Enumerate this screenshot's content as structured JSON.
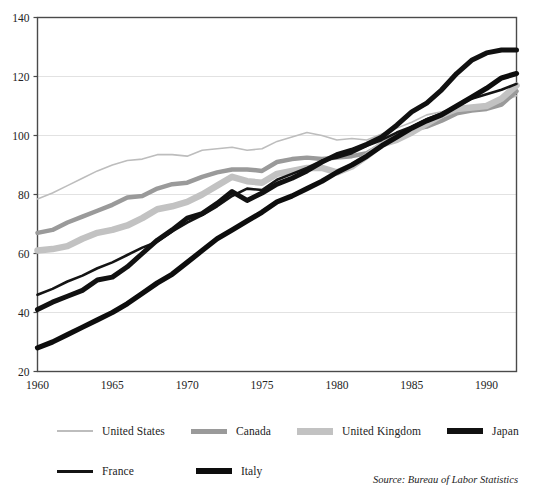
{
  "chart_data": {
    "type": "line",
    "title": "",
    "subtitle": "",
    "xlabel": "",
    "ylabel": "",
    "xlim": [
      1960,
      1992
    ],
    "ylim": [
      20,
      140
    ],
    "x_ticks": [
      1960,
      1965,
      1970,
      1975,
      1980,
      1985,
      1990
    ],
    "y_ticks": [
      20,
      40,
      60,
      80,
      100,
      120,
      140
    ],
    "grid": "horizontal",
    "legend_position": "below",
    "source_note": "Source: Bureau of Labor Statistics",
    "x": [
      1960,
      1961,
      1962,
      1963,
      1964,
      1965,
      1966,
      1967,
      1968,
      1969,
      1970,
      1971,
      1972,
      1973,
      1974,
      1975,
      1976,
      1977,
      1978,
      1979,
      1980,
      1981,
      1982,
      1983,
      1984,
      1985,
      1986,
      1987,
      1988,
      1989,
      1990,
      1991,
      1992
    ],
    "series": [
      {
        "name": "United States",
        "color": "#bdbdbd",
        "width": 1.6,
        "values": [
          78.5,
          80.5,
          83.0,
          85.5,
          88.0,
          90.0,
          91.5,
          92.0,
          93.5,
          93.5,
          93.0,
          95.0,
          95.5,
          96.0,
          95.0,
          95.5,
          98.0,
          99.5,
          101.0,
          100.0,
          98.5,
          99.0,
          98.5,
          100.5,
          102.5,
          104.5,
          107.0,
          108.0,
          109.0,
          110.0,
          110.5,
          111.5,
          113.5
        ]
      },
      {
        "name": "Canada",
        "color": "#9a9a9a",
        "width": 4.5,
        "values": [
          67.0,
          68.0,
          70.5,
          72.5,
          74.5,
          76.5,
          79.0,
          79.5,
          82.0,
          83.5,
          84.0,
          86.0,
          87.5,
          88.5,
          88.5,
          88.0,
          91.0,
          92.0,
          92.5,
          92.0,
          92.5,
          93.0,
          94.0,
          97.0,
          100.0,
          102.0,
          103.0,
          105.0,
          107.5,
          108.5,
          109.0,
          110.5,
          115.0
        ]
      },
      {
        "name": "United Kingdom",
        "color": "#c2c2c2",
        "width": 6.5,
        "values": [
          61.0,
          61.5,
          62.5,
          65.0,
          67.0,
          68.0,
          69.5,
          72.0,
          75.0,
          76.0,
          77.5,
          80.0,
          83.0,
          86.0,
          84.5,
          84.0,
          87.0,
          88.0,
          89.0,
          89.0,
          87.5,
          89.5,
          93.0,
          97.0,
          98.5,
          101.0,
          104.0,
          107.0,
          109.0,
          109.5,
          110.0,
          112.5,
          117.0
        ]
      },
      {
        "name": "Japan",
        "color": "#111111",
        "width": 5.0,
        "values": [
          41.0,
          43.5,
          45.5,
          47.5,
          51.0,
          52.0,
          55.5,
          60.0,
          64.5,
          68.0,
          72.0,
          73.5,
          77.0,
          81.0,
          78.0,
          80.5,
          83.5,
          85.5,
          88.0,
          91.0,
          93.5,
          95.0,
          97.0,
          99.5,
          103.5,
          108.0,
          111.0,
          115.5,
          121.0,
          125.5,
          128.0,
          129.0,
          129.0
        ]
      },
      {
        "name": "France",
        "color": "#141414",
        "width": 2.6,
        "values": [
          46.0,
          48.0,
          50.5,
          52.5,
          55.0,
          57.0,
          59.5,
          62.0,
          64.0,
          67.5,
          70.5,
          73.0,
          76.0,
          79.5,
          82.0,
          81.5,
          85.0,
          87.0,
          89.0,
          91.5,
          92.5,
          94.0,
          96.5,
          98.5,
          101.0,
          103.0,
          105.5,
          107.5,
          110.0,
          112.5,
          114.0,
          115.5,
          117.5
        ]
      },
      {
        "name": "Italy",
        "color": "#0d0d0d",
        "width": 5.2,
        "values": [
          28.0,
          30.0,
          32.5,
          35.0,
          37.5,
          40.0,
          43.0,
          46.5,
          50.0,
          53.0,
          57.0,
          61.0,
          65.0,
          68.0,
          71.0,
          74.0,
          77.5,
          79.5,
          82.0,
          84.5,
          87.5,
          90.0,
          93.0,
          96.5,
          99.5,
          102.5,
          105.0,
          107.0,
          110.0,
          113.0,
          116.0,
          119.5,
          121.0
        ]
      }
    ]
  },
  "legend": {
    "rows": [
      [
        {
          "label": "United States",
          "color": "#bdbdbd",
          "thickness": 2
        },
        {
          "label": "Canada",
          "color": "#9a9a9a",
          "thickness": 5
        },
        {
          "label": "United Kingdom",
          "color": "#c2c2c2",
          "thickness": 7
        },
        {
          "label": "Japan",
          "color": "#111111",
          "thickness": 6
        }
      ],
      [
        {
          "label": "France",
          "color": "#141414",
          "thickness": 3
        },
        {
          "label": "Italy",
          "color": "#0d0d0d",
          "thickness": 6
        }
      ]
    ]
  },
  "axes": {
    "y_tick_labels": [
      "140",
      "120",
      "100",
      "80",
      "60",
      "40",
      "20"
    ],
    "x_tick_labels": [
      "1960",
      "1965",
      "1970",
      "1975",
      "1980",
      "1985",
      "1990"
    ]
  },
  "colors": {
    "axis": "#4a4a4a",
    "grid": "#e2e2e2",
    "background": "#ffffff",
    "text": "#232323"
  }
}
